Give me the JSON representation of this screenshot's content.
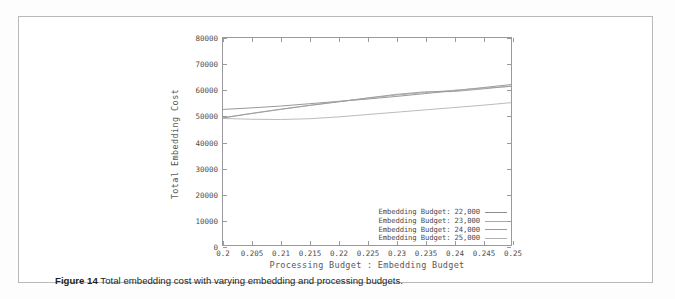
{
  "figure": {
    "caption_label": "Figure 14",
    "caption_text": "Total embedding cost with varying embedding and processing budgets."
  },
  "chart_data": {
    "type": "line",
    "title": "",
    "xlabel": "Processing Budget : Embedding Budget",
    "ylabel": "Total Embedding Cost",
    "xlim": [
      0.2,
      0.25
    ],
    "ylim": [
      0,
      80000
    ],
    "grid": false,
    "legend_position": "bottom-right-inside",
    "xticks": [
      "0.2",
      "0.205",
      "0.21",
      "0.215",
      "0.22",
      "0.225",
      "0.23",
      "0.235",
      "0.24",
      "0.245",
      "0.25"
    ],
    "xtick_values": [
      0.2,
      0.205,
      0.21,
      0.215,
      0.22,
      0.225,
      0.23,
      0.235,
      0.24,
      0.245,
      0.25
    ],
    "yticks": [
      "0",
      "10000",
      "20000",
      "30000",
      "40000",
      "50000",
      "60000",
      "70000",
      "80000"
    ],
    "ytick_values": [
      0,
      10000,
      20000,
      30000,
      40000,
      50000,
      60000,
      70000,
      80000
    ],
    "x": [
      0.2,
      0.205,
      0.21,
      0.215,
      0.22,
      0.225,
      0.23,
      0.235,
      0.24,
      0.245,
      0.25
    ],
    "series": [
      {
        "name": "Embedding Budget: 22,000",
        "color": "#8d8d90",
        "values": [
          52400,
          53000,
          53700,
          54600,
          55500,
          56400,
          57400,
          58500,
          59600,
          60800,
          62000
        ]
      },
      {
        "name": "Embedding Budget: 23,000",
        "color": "#a9a9ad",
        "values": [
          49200,
          50900,
          52500,
          54000,
          55400,
          56700,
          57900,
          58900,
          59800,
          60600,
          61300
        ]
      },
      {
        "name": "Embedding Budget: 24,000",
        "color": "#9a9a9e",
        "values": [
          49100,
          50800,
          52400,
          53900,
          55300,
          56800,
          58200,
          59200,
          59300,
          60300,
          61400
        ]
      },
      {
        "name": "Embedding Budget: 25,000",
        "color": "#b3b3b7",
        "values": [
          48900,
          48600,
          48500,
          48800,
          49500,
          50400,
          51300,
          52200,
          53100,
          54000,
          55000
        ]
      }
    ]
  }
}
